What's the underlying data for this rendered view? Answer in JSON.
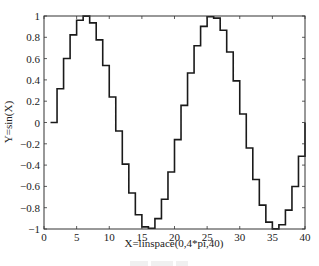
{
  "chart_data": {
    "type": "line",
    "style": "stairs",
    "title": "",
    "xlabel": "X=linspace(0,4*pi,40)",
    "ylabel": "Y=sin(X)",
    "xlim": [
      0,
      40
    ],
    "ylim": [
      -1,
      1
    ],
    "xticks": [
      0,
      5,
      10,
      15,
      20,
      25,
      30,
      35,
      40
    ],
    "yticks": [
      -1,
      -0.8,
      -0.6,
      -0.4,
      -0.2,
      0,
      0.2,
      0.4,
      0.6,
      0.8,
      1
    ],
    "ytick_labels": [
      "-1",
      "-0.8",
      "-0.6",
      "-0.4",
      "-0.2",
      "0",
      "0.2",
      "0.4",
      "0.6",
      "0.8",
      "1"
    ],
    "grid": false,
    "legend": null,
    "line_color": "#1a1a1a",
    "x": [
      1,
      2,
      3,
      4,
      5,
      6,
      7,
      8,
      9,
      10,
      11,
      12,
      13,
      14,
      15,
      16,
      17,
      18,
      19,
      20,
      21,
      22,
      23,
      24,
      25,
      26,
      27,
      28,
      29,
      30,
      31,
      32,
      33,
      34,
      35,
      36,
      37,
      38,
      39,
      40
    ],
    "values": [
      0,
      0.3166,
      0.6007,
      0.823,
      0.9605,
      0.9992,
      0.935,
      0.7757,
      0.5358,
      0.2393,
      -0.0805,
      -0.3904,
      -0.6617,
      -0.866,
      -0.9805,
      -0.9928,
      -0.9029,
      -0.7203,
      -0.4647,
      -0.1604,
      0.1604,
      0.4647,
      0.7203,
      0.9029,
      0.9928,
      0.9805,
      0.866,
      0.6617,
      0.3904,
      0.0805,
      -0.2393,
      -0.5358,
      -0.7757,
      -0.935,
      -0.9992,
      -0.9605,
      -0.823,
      -0.6007,
      -0.3166,
      0
    ]
  }
}
